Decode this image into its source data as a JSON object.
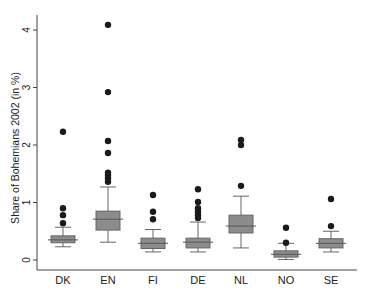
{
  "chart_data": {
    "type": "boxplot",
    "title": "",
    "xlabel": "",
    "ylabel": "Share of Bohemians 2002 (in %)",
    "ylim": [
      -0.1,
      4.2
    ],
    "yticks": [
      0,
      1,
      2,
      3,
      4
    ],
    "grid": false,
    "legend": null,
    "categories": [
      "DK",
      "EN",
      "FI",
      "DE",
      "NL",
      "NO",
      "SE"
    ],
    "box_color": "#8c8c8c",
    "series": [
      {
        "name": "DK",
        "whisker_low": 0.23,
        "q1": 0.3,
        "median": 0.35,
        "q3": 0.42,
        "whisker_high": 0.57,
        "outliers": [
          0.64,
          0.78,
          0.9,
          2.23
        ]
      },
      {
        "name": "EN",
        "whisker_low": 0.31,
        "q1": 0.52,
        "median": 0.71,
        "q3": 0.85,
        "whisker_high": 1.27,
        "outliers": [
          1.36,
          1.42,
          1.47,
          1.52,
          1.86,
          2.07,
          2.92,
          4.09
        ]
      },
      {
        "name": "FI",
        "whisker_low": 0.14,
        "q1": 0.2,
        "median": 0.29,
        "q3": 0.38,
        "whisker_high": 0.53,
        "outliers": [
          0.71,
          0.84,
          1.13
        ]
      },
      {
        "name": "DE",
        "whisker_low": 0.14,
        "q1": 0.21,
        "median": 0.31,
        "q3": 0.38,
        "whisker_high": 0.66,
        "outliers": [
          0.73,
          0.78,
          0.84,
          0.9,
          1.01,
          1.23
        ]
      },
      {
        "name": "NL",
        "whisker_low": 0.21,
        "q1": 0.47,
        "median": 0.59,
        "q3": 0.78,
        "whisker_high": 1.11,
        "outliers": [
          1.29,
          2.0,
          2.09
        ]
      },
      {
        "name": "NO",
        "whisker_low": 0.01,
        "q1": 0.05,
        "median": 0.1,
        "q3": 0.16,
        "whisker_high": 0.29,
        "outliers": [
          0.3,
          0.56
        ]
      },
      {
        "name": "SE",
        "whisker_low": 0.14,
        "q1": 0.21,
        "median": 0.29,
        "q3": 0.37,
        "whisker_high": 0.5,
        "outliers": [
          0.59,
          1.06
        ]
      }
    ]
  },
  "layout": {
    "axis_x": 37,
    "axis_top": 15,
    "axis_bottom": 270,
    "axis_right": 357,
    "zero_y": 260,
    "px_per_unit": 57.5,
    "cat_x": [
      63,
      108,
      153,
      198,
      241,
      286,
      331
    ],
    "box_width": 24
  }
}
